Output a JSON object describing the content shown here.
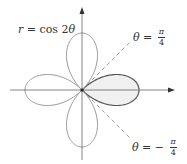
{
  "figure": {
    "equation_label": {
      "var": "r",
      "equals": " = ",
      "func": "cos 2",
      "theta": "θ"
    },
    "line_upper_label": {
      "theta": "θ",
      "equals": " = ",
      "sign": "",
      "num": "π",
      "den": "4"
    },
    "line_lower_label": {
      "theta": "θ",
      "equals": " = ",
      "sign": "− ",
      "num": "π",
      "den": "4"
    },
    "colors": {
      "curve": "#9a9a9a",
      "highlight_outline": "#555555",
      "highlight_fill": "#f0f0f0",
      "axes": "#666666",
      "dashed": "#888888",
      "text": "#333333"
    }
  },
  "chart_data": {
    "type": "polar-curve",
    "equation": "r = cos 2θ",
    "petals": 4,
    "highlighted_petal": {
      "theta_from": "-π/4",
      "theta_to": "π/4",
      "shaded": true
    },
    "reference_lines": [
      "θ = π/4",
      "θ = -π/4"
    ],
    "axes": {
      "x_arrow": true,
      "y_arrow": true,
      "grid": false
    }
  }
}
